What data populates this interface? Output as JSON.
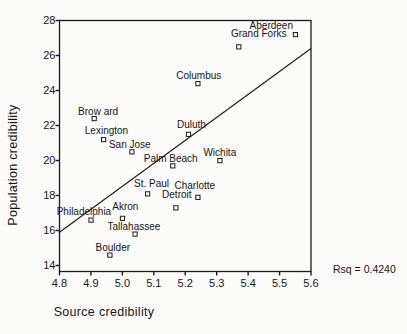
{
  "chart_data": {
    "type": "scatter",
    "title": "",
    "xlabel": "Source credibility",
    "ylabel": "Population credibility",
    "xlim": [
      4.8,
      5.6
    ],
    "ylim": [
      13.66,
      28
    ],
    "x_ticks": [
      4.8,
      4.9,
      5.0,
      5.1,
      5.2,
      5.3,
      5.4,
      5.5,
      5.6
    ],
    "y_ticks": [
      14,
      16,
      18,
      20,
      22,
      24,
      26,
      28
    ],
    "grid": false,
    "marker": "open-square",
    "marker_color": "#1a1a1a",
    "points": [
      {
        "label": "Aberdeen",
        "x": 5.55,
        "y": 27.2,
        "label_dx": -24,
        "label_dy": -10
      },
      {
        "label": "Grand Forks",
        "x": 5.37,
        "y": 26.5,
        "label_dx": 20,
        "label_dy": -14
      },
      {
        "label": "Columbus",
        "x": 5.24,
        "y": 24.4,
        "label_dx": 1,
        "label_dy": -9
      },
      {
        "label": "Brow ard",
        "x": 4.91,
        "y": 22.4,
        "label_dx": 4,
        "label_dy": -8
      },
      {
        "label": "Lexington",
        "x": 4.94,
        "y": 21.2,
        "label_dx": 3,
        "label_dy": -10
      },
      {
        "label": "San Jose",
        "x": 5.03,
        "y": 20.5,
        "label_dx": -2,
        "label_dy": -8
      },
      {
        "label": "Duluth",
        "x": 5.21,
        "y": 21.5,
        "label_dx": 3,
        "label_dy": -10
      },
      {
        "label": "Wichita",
        "x": 5.31,
        "y": 20.0,
        "label_dx": 0,
        "label_dy": -9
      },
      {
        "label": "Palm Beach",
        "x": 5.16,
        "y": 19.7,
        "label_dx": -2,
        "label_dy": -8
      },
      {
        "label": "St. Paul",
        "x": 5.08,
        "y": 18.1,
        "label_dx": 4,
        "label_dy": -11
      },
      {
        "label": "Charlotte",
        "x": 5.24,
        "y": 17.9,
        "label_dx": -3,
        "label_dy": -12
      },
      {
        "label": "Detroit",
        "x": 5.17,
        "y": 17.3,
        "label_dx": 1,
        "label_dy": -14
      },
      {
        "label": "Akron",
        "x": 5.0,
        "y": 16.7,
        "label_dx": 3,
        "label_dy": -12
      },
      {
        "label": "Philadelphia",
        "x": 4.9,
        "y": 16.6,
        "label_dx": -7,
        "label_dy": -9
      },
      {
        "label": "Tallahassee",
        "x": 5.04,
        "y": 15.8,
        "label_dx": -1,
        "label_dy": -8
      },
      {
        "label": "Boulder",
        "x": 4.96,
        "y": 14.6,
        "label_dx": 3,
        "label_dy": -8
      }
    ],
    "fit_line": {
      "x1": 4.8,
      "y1": 15.9,
      "x2": 5.6,
      "y2": 26.4
    },
    "annotation": "Rsq = 0.4240"
  }
}
